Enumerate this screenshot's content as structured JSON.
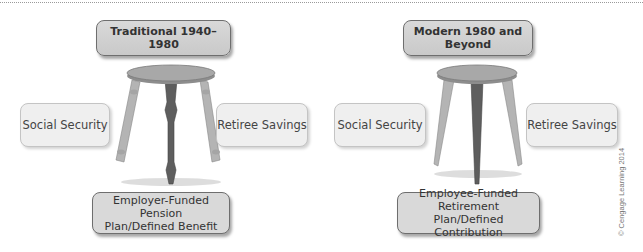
{
  "left_panel": {
    "title": "Traditional 1940–1980",
    "left_leg_label": "Social Security",
    "right_leg_label": "Retiree Savings",
    "bottom_label_line1": "Employer-Funded Pension",
    "bottom_label_line2": "Plan/Defined Benefit",
    "stool_style": "turned-legs"
  },
  "right_panel": {
    "title": "Modern 1980 and Beyond",
    "left_leg_label": "Social Security",
    "right_leg_label": "Retiree Savings",
    "bottom_label_line1": "Employee-Funded Retirement",
    "bottom_label_line2": "Plan/Defined Contribution",
    "stool_style": "tapered-legs"
  },
  "credit": "© Cengage Learning 2014",
  "colors": {
    "box_fill": "#d6d6d6",
    "side_box_fill": "#efefef",
    "seat": "#a0a0a0",
    "front_leg": "#5e5e5e",
    "side_leg": "#b4b4b4"
  }
}
